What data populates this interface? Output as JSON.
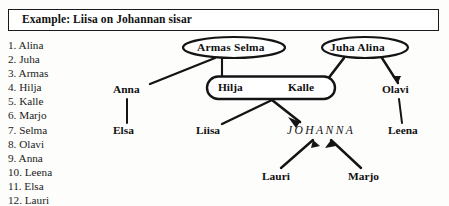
{
  "title": {
    "text": "Example: Liisa on Johannan sisar"
  },
  "name_list": {
    "items": [
      "1. Alina",
      "2. Juha",
      "3. Armas",
      "4. Hilja",
      "5. Kalle",
      "6. Marjo",
      "7. Selma",
      "8. Olavi",
      "9. Anna",
      "10. Leena",
      "11. Elsa",
      "12. Lauri"
    ]
  },
  "diagram": {
    "nodes": {
      "armas_selma": "Armas  Selma",
      "juha_alina": "Juha   Alina",
      "hilja": "Hilja",
      "kalle": "Kalle",
      "anna": "Anna",
      "elsa": "Elsa",
      "liisa": "Liisa",
      "johanna": "JOHANNA",
      "lauri": "Lauri",
      "marjo": "Marjo",
      "olavi": "Olavi",
      "leena": "Leena"
    },
    "colors": {
      "ink": "#111111",
      "paper": "#fdfdfc",
      "border": "#1a1a1a"
    }
  }
}
